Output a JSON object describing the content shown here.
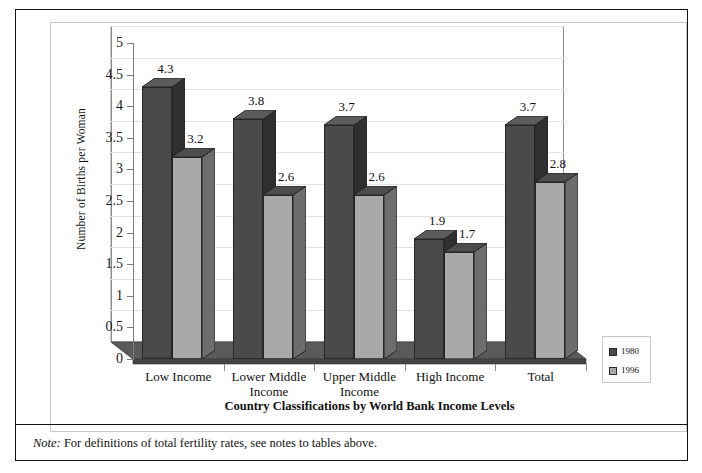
{
  "figure": {
    "xaxis_title": "Country Classifications by World Bank Income Levels",
    "yaxis_title": "Number of Births per Woman",
    "note_prefix": "Note:",
    "note_text": " For definitions of total fertility rates, see notes to tables above."
  },
  "chart_data": {
    "type": "bar",
    "title": "",
    "subtitle": "",
    "xlabel": "Country Classifications by World Bank Income Levels",
    "ylabel": "Number of Births per Woman",
    "ylim": [
      0,
      5
    ],
    "ytick_labels": [
      "0",
      "0.5",
      "1",
      "1.5",
      "2",
      "2.5",
      "3",
      "3.5",
      "4",
      "4.5",
      "5"
    ],
    "ytick_values": [
      0,
      0.5,
      1,
      1.5,
      2,
      2.5,
      3,
      3.5,
      4,
      4.5,
      5
    ],
    "grid": true,
    "legend_position": "right-bottom",
    "style": "3d-clustered-column",
    "categories": [
      "Low Income",
      "Lower Middle Income",
      "Upper Middle Income",
      "High Income",
      "Total"
    ],
    "category_lines": [
      [
        "Low Income"
      ],
      [
        "Lower Middle",
        "Income"
      ],
      [
        "Upper Middle",
        "Income"
      ],
      [
        "High Income"
      ],
      [
        "Total"
      ]
    ],
    "series": [
      {
        "name": "1980",
        "color": "#4a4a4a",
        "values": [
          4.3,
          3.8,
          3.7,
          1.9,
          3.7
        ],
        "labels": [
          "4.3",
          "3.8",
          "3.7",
          "1.9",
          "3.7"
        ]
      },
      {
        "name": "1996",
        "color": "#a9a9a9",
        "values": [
          3.2,
          2.6,
          2.6,
          1.7,
          2.8
        ],
        "labels": [
          "3.2",
          "2.6",
          "2.6",
          "1.7",
          "2.8"
        ]
      }
    ]
  },
  "legend": {
    "items": [
      {
        "label": "1980",
        "color": "#4a4a4a"
      },
      {
        "label": "1996",
        "color": "#a9a9a9"
      }
    ]
  }
}
